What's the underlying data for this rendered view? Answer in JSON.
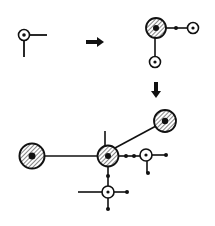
{
  "diagram": {
    "colors": {
      "stroke": "#111111",
      "fill": "#ffffff",
      "hatch": "#333333",
      "background": "#ffffff"
    },
    "stages": [
      {
        "id": "stage-1",
        "label": "seed node"
      },
      {
        "id": "stage-2",
        "label": "hub with two leaves"
      },
      {
        "id": "stage-3",
        "label": "expanded network"
      }
    ],
    "arrows": [
      {
        "id": "arrow-right",
        "direction": "right"
      },
      {
        "id": "arrow-down",
        "direction": "down"
      }
    ]
  }
}
